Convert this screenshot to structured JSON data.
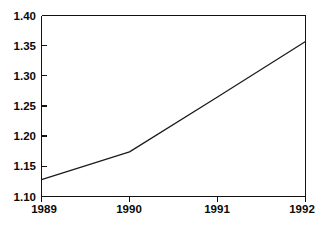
{
  "chart_data": {
    "type": "line",
    "title": "",
    "subtitle": "",
    "xlabel": "",
    "ylabel": "",
    "x": [
      1989,
      1990,
      1991,
      1992
    ],
    "values": [
      1.128,
      1.174,
      1.265,
      1.357
    ],
    "series": [
      {
        "name": "",
        "values": [
          1.128,
          1.174,
          1.265,
          1.357
        ]
      }
    ],
    "xlim": [
      1989,
      1992
    ],
    "ylim": [
      1.1,
      1.4
    ],
    "x_tick_labels": [
      "1989",
      "1990",
      "1991",
      "1992"
    ],
    "y_tick_values": [
      1.1,
      1.15,
      1.2,
      1.25,
      1.3,
      1.35,
      1.4
    ],
    "y_tick_labels": [
      "1.10",
      "1.15",
      "1.20",
      "1.25",
      "1.30",
      "1.35",
      "1.40"
    ],
    "grid": false,
    "legend": false,
    "legend_position": "none",
    "annotations": []
  },
  "style": {
    "line_color": "#1a1a1a",
    "axis_color": "#111111",
    "background_color": "#ffffff",
    "text_color": "#0a0a0a"
  },
  "axis": {
    "y_labels": {
      "t0": "1.10",
      "t1": "1.15",
      "t2": "1.20",
      "t3": "1.25",
      "t4": "1.30",
      "t5": "1.35",
      "t6": "1.40"
    },
    "x_labels": {
      "t0": "1989",
      "t1": "1990",
      "t2": "1991",
      "t3": "1992"
    }
  }
}
